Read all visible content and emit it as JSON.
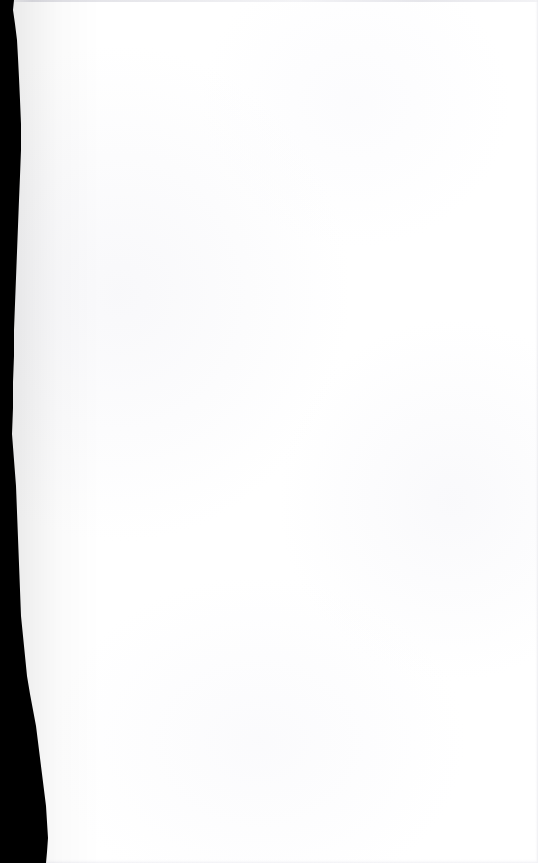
{
  "document": {
    "kind": "scanned-page",
    "page_content_text": "",
    "page_body_note": "",
    "width_px": 538,
    "height_px": 863
  },
  "colors": {
    "page_background": "#ffffff",
    "gutter_shadow": "#000000",
    "scan_edge_line": "#e2e2e8",
    "paper_tint": "#f7f7fa"
  },
  "gutter": {
    "name": "left-binding-shadow",
    "min_width_px": 12,
    "max_width_px": 49,
    "profile_points": [
      {
        "y": 0,
        "x": 14
      },
      {
        "y": 10,
        "x": 13
      },
      {
        "y": 24,
        "x": 15
      },
      {
        "y": 40,
        "x": 17
      },
      {
        "y": 58,
        "x": 18
      },
      {
        "y": 78,
        "x": 19
      },
      {
        "y": 100,
        "x": 20
      },
      {
        "y": 124,
        "x": 21
      },
      {
        "y": 150,
        "x": 21
      },
      {
        "y": 176,
        "x": 20
      },
      {
        "y": 200,
        "x": 19
      },
      {
        "y": 226,
        "x": 18
      },
      {
        "y": 252,
        "x": 17
      },
      {
        "y": 278,
        "x": 16
      },
      {
        "y": 304,
        "x": 15
      },
      {
        "y": 330,
        "x": 14
      },
      {
        "y": 356,
        "x": 14
      },
      {
        "y": 382,
        "x": 13
      },
      {
        "y": 408,
        "x": 13
      },
      {
        "y": 434,
        "x": 12
      },
      {
        "y": 460,
        "x": 14
      },
      {
        "y": 486,
        "x": 16
      },
      {
        "y": 512,
        "x": 17
      },
      {
        "y": 538,
        "x": 18
      },
      {
        "y": 564,
        "x": 19
      },
      {
        "y": 590,
        "x": 20
      },
      {
        "y": 616,
        "x": 21
      },
      {
        "y": 636,
        "x": 23
      },
      {
        "y": 656,
        "x": 25
      },
      {
        "y": 676,
        "x": 27
      },
      {
        "y": 694,
        "x": 30
      },
      {
        "y": 710,
        "x": 33
      },
      {
        "y": 726,
        "x": 36
      },
      {
        "y": 742,
        "x": 38
      },
      {
        "y": 758,
        "x": 40
      },
      {
        "y": 774,
        "x": 42
      },
      {
        "y": 790,
        "x": 44
      },
      {
        "y": 806,
        "x": 46
      },
      {
        "y": 822,
        "x": 47
      },
      {
        "y": 838,
        "x": 48
      },
      {
        "y": 852,
        "x": 47
      },
      {
        "y": 863,
        "x": 46
      }
    ]
  },
  "edges": {
    "top_line_label": "",
    "right_edge_label": "",
    "bottom_edge_label": ""
  }
}
